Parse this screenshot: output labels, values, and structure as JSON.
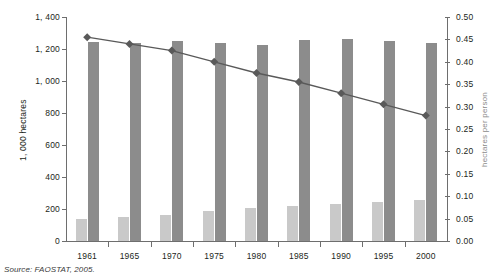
{
  "chart_data": {
    "type": "bar",
    "title": "",
    "subtitle": "",
    "categories": [
      "1961",
      "1965",
      "1970",
      "1975",
      "1980",
      "1985",
      "1990",
      "1995",
      "2000"
    ],
    "xlabel": "",
    "ylabel": "1, 000 hectares",
    "ylabel_right": "hectares per person",
    "ylim": [
      0,
      1400
    ],
    "ylim_right": [
      0.0,
      0.5
    ],
    "yticks": [
      "0",
      "200",
      "400",
      "600",
      "800",
      "1, 000",
      "1, 200",
      "1, 400"
    ],
    "ytick_values": [
      0,
      200,
      400,
      600,
      800,
      1000,
      1200,
      1400
    ],
    "yticks_right": [
      "0.00",
      "0.05",
      "0.10",
      "0.15",
      "0.20",
      "0.25",
      "0.30",
      "0.35",
      "0.40",
      "0.45",
      "0.50"
    ],
    "ytick_values_right": [
      0.0,
      0.05,
      0.1,
      0.15,
      0.2,
      0.25,
      0.3,
      0.35,
      0.4,
      0.45,
      0.5
    ],
    "grid": false,
    "legend": "none",
    "series": [
      {
        "name": "light-bar-series",
        "type": "bar",
        "axis": "left",
        "color": "#c9c9c9",
        "values": [
          135,
          150,
          165,
          185,
          205,
          220,
          232,
          243,
          255
        ]
      },
      {
        "name": "dark-bar-series",
        "type": "bar",
        "axis": "left",
        "color": "#8c8c8c",
        "values": [
          1245,
          1235,
          1250,
          1235,
          1225,
          1255,
          1260,
          1250,
          1240
        ]
      },
      {
        "name": "line-series",
        "type": "line",
        "axis": "right",
        "color": "#595959",
        "marker": "diamond",
        "values": [
          0.455,
          0.44,
          0.425,
          0.4,
          0.375,
          0.355,
          0.33,
          0.305,
          0.28
        ]
      }
    ]
  },
  "source": {
    "text": "Source: FAOSTAT, 2005."
  },
  "colors": {
    "bar_light": "#c9c9c9",
    "bar_dark": "#8c8c8c",
    "line": "#595959",
    "axis": "#6e6e6e",
    "text": "#231f20"
  }
}
